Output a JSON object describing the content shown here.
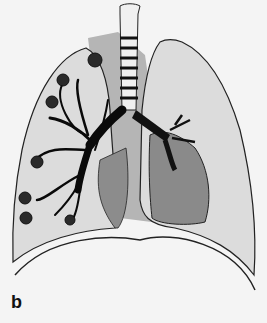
{
  "figure": {
    "panel_label": "b",
    "colors": {
      "background": "#f4f4f4",
      "lung_fill": "#dcdcdc",
      "shaded_region": "#9a9a9a",
      "dark_region": "#6e6e6e",
      "outline": "#222222",
      "bronchi": "#0a0a0a",
      "trachea_fill": "#f0f0f0"
    }
  }
}
